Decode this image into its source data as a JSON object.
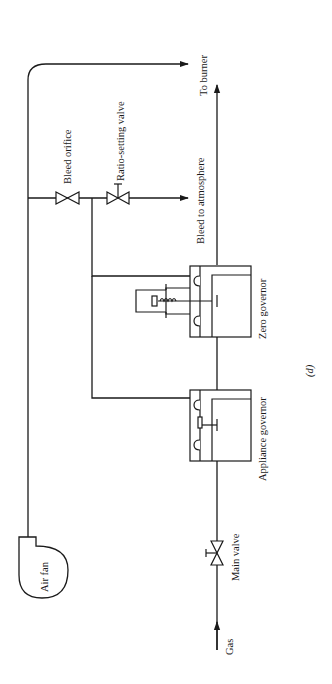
{
  "diagram": {
    "figure_label": "(d)",
    "labels": {
      "air_fan": "Air fan",
      "gas": "Gas",
      "main_valve": "Main valve",
      "appliance_governor": "Appliance governor",
      "zero_governor": "Zero governor",
      "bleed_orifice": "Bleed orifice",
      "ratio_setting_valve": "Ratio-setting valve",
      "bleed_to_atmosphere": "Bleed to atmosphere",
      "to_burner": "To burner"
    },
    "colors": {
      "line": "#1a1a1a",
      "background": "#ffffff"
    }
  }
}
